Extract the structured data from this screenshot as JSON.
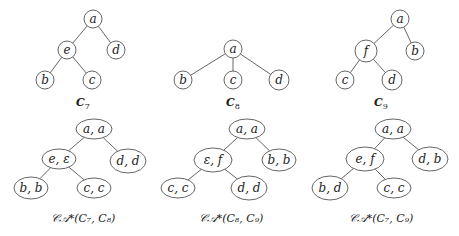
{
  "trees": [
    {
      "id": "C7",
      "caption": "C",
      "caption_sub": "7",
      "caption_pos": [
        83,
        106
      ],
      "nodes": [
        {
          "id": "a",
          "label": "a",
          "x": 93,
          "y": 19,
          "rx": 9,
          "ry": 9
        },
        {
          "id": "e",
          "label": "e",
          "x": 67,
          "y": 50,
          "rx": 9,
          "ry": 9
        },
        {
          "id": "d",
          "label": "d",
          "x": 116,
          "y": 50,
          "rx": 9,
          "ry": 9
        },
        {
          "id": "b",
          "label": "b",
          "x": 45,
          "y": 80,
          "rx": 9,
          "ry": 9
        },
        {
          "id": "c",
          "label": "c",
          "x": 92,
          "y": 80,
          "rx": 9,
          "ry": 9
        }
      ],
      "edges": [
        [
          "a",
          "e"
        ],
        [
          "a",
          "d"
        ],
        [
          "e",
          "b"
        ],
        [
          "e",
          "c"
        ]
      ]
    },
    {
      "id": "C8",
      "caption": "C",
      "caption_sub": "8",
      "caption_pos": [
        233,
        106
      ],
      "nodes": [
        {
          "id": "a",
          "label": "a",
          "x": 233,
          "y": 49,
          "rx": 9,
          "ry": 9
        },
        {
          "id": "b",
          "label": "b",
          "x": 183,
          "y": 80,
          "rx": 9,
          "ry": 9
        },
        {
          "id": "c",
          "label": "c",
          "x": 233,
          "y": 80,
          "rx": 9,
          "ry": 9
        },
        {
          "id": "d",
          "label": "d",
          "x": 279,
          "y": 80,
          "rx": 10,
          "ry": 10
        }
      ],
      "edges": [
        [
          "a",
          "b"
        ],
        [
          "a",
          "c"
        ],
        [
          "a",
          "d"
        ]
      ]
    },
    {
      "id": "C9",
      "caption": "C",
      "caption_sub": "9",
      "caption_pos": [
        381,
        106
      ],
      "nodes": [
        {
          "id": "a",
          "label": "a",
          "x": 400,
          "y": 19,
          "rx": 9,
          "ry": 9
        },
        {
          "id": "f",
          "label": "f",
          "x": 366,
          "y": 51,
          "rx": 11,
          "ry": 11
        },
        {
          "id": "b",
          "label": "b",
          "x": 415,
          "y": 51,
          "rx": 9,
          "ry": 9
        },
        {
          "id": "c",
          "label": "c",
          "x": 345,
          "y": 80,
          "rx": 9,
          "ry": 9
        },
        {
          "id": "d",
          "label": "d",
          "x": 392,
          "y": 80,
          "rx": 10,
          "ry": 10
        }
      ],
      "edges": [
        [
          "a",
          "f"
        ],
        [
          "a",
          "b"
        ],
        [
          "f",
          "c"
        ],
        [
          "f",
          "d"
        ]
      ]
    },
    {
      "id": "CA_C7_C8",
      "caption": "𝒞𝒜*(",
      "caption_full": "𝒞𝒜*(C₇, C₈)",
      "caption_pos": [
        83,
        222
      ],
      "nodes": [
        {
          "id": "aa",
          "label": "a, a",
          "x": 94,
          "y": 129,
          "rx": 18,
          "ry": 10
        },
        {
          "id": "ee",
          "label": "e, ε",
          "x": 59,
          "y": 159,
          "rx": 17,
          "ry": 10
        },
        {
          "id": "dd",
          "label": "d, d",
          "x": 128,
          "y": 161,
          "rx": 18,
          "ry": 12
        },
        {
          "id": "bb",
          "label": "b, b",
          "x": 31,
          "y": 188,
          "rx": 17,
          "ry": 11
        },
        {
          "id": "cc",
          "label": "c, c",
          "x": 94,
          "y": 188,
          "rx": 17,
          "ry": 10
        }
      ],
      "edges": [
        [
          "aa",
          "ee"
        ],
        [
          "aa",
          "dd"
        ],
        [
          "ee",
          "bb"
        ],
        [
          "ee",
          "cc"
        ]
      ]
    },
    {
      "id": "CA_C8_C9",
      "caption_full": "𝒞𝒜*(C₈, C₉)",
      "caption_pos": [
        231,
        222
      ],
      "nodes": [
        {
          "id": "aa",
          "label": "a, a",
          "x": 247,
          "y": 129,
          "rx": 18,
          "ry": 10
        },
        {
          "id": "ef",
          "label": "ε, f",
          "x": 213,
          "y": 160,
          "rx": 19,
          "ry": 12
        },
        {
          "id": "bb",
          "label": "b, b",
          "x": 279,
          "y": 160,
          "rx": 17,
          "ry": 11
        },
        {
          "id": "cc",
          "label": "c, c",
          "x": 178,
          "y": 188,
          "rx": 17,
          "ry": 10
        },
        {
          "id": "dd",
          "label": "d, d",
          "x": 249,
          "y": 188,
          "rx": 18,
          "ry": 12
        }
      ],
      "edges": [
        [
          "aa",
          "ef"
        ],
        [
          "aa",
          "bb"
        ],
        [
          "ef",
          "cc"
        ],
        [
          "ef",
          "dd"
        ]
      ]
    },
    {
      "id": "CA_C7_C9",
      "caption_full": "𝒞𝒜*(C₇, C₉)",
      "caption_pos": [
        381,
        222
      ],
      "nodes": [
        {
          "id": "aa",
          "label": "a, a",
          "x": 393,
          "y": 129,
          "rx": 18,
          "ry": 10
        },
        {
          "id": "ef",
          "label": "e, f",
          "x": 365,
          "y": 159,
          "rx": 19,
          "ry": 12
        },
        {
          "id": "db",
          "label": "d, b",
          "x": 430,
          "y": 159,
          "rx": 18,
          "ry": 12
        },
        {
          "id": "bd",
          "label": "b, d",
          "x": 330,
          "y": 188,
          "rx": 18,
          "ry": 12
        },
        {
          "id": "cc",
          "label": "c, c",
          "x": 394,
          "y": 188,
          "rx": 17,
          "ry": 10
        }
      ],
      "edges": [
        [
          "aa",
          "ef"
        ],
        [
          "aa",
          "db"
        ],
        [
          "ef",
          "bd"
        ],
        [
          "ef",
          "cc"
        ]
      ]
    }
  ]
}
